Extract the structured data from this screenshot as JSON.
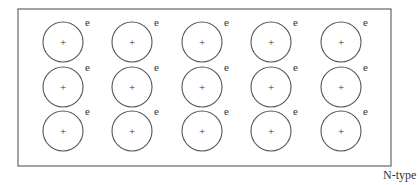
{
  "diagram": {
    "title": "",
    "caption": "N-type",
    "box": {
      "x": 18,
      "y": 9,
      "width": 373,
      "height": 157
    },
    "grid": {
      "rows": 3,
      "cols": 5
    },
    "atom": {
      "symbol": "+",
      "electron_label": "e",
      "radius": 20
    },
    "column_x": [
      63,
      132,
      202,
      271,
      341
    ],
    "row_y": [
      42,
      87,
      131
    ],
    "colors": {
      "stroke": "#555555",
      "text": "#333333",
      "background": "#ffffff"
    }
  }
}
